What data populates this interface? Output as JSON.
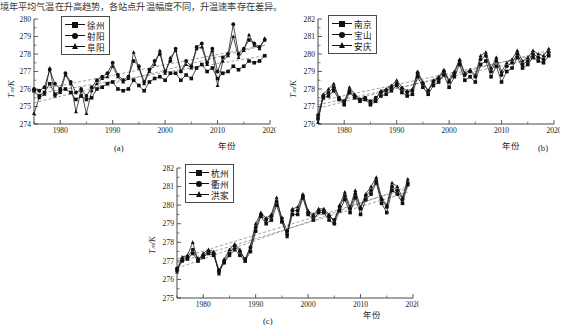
{
  "top_caption": "境年平均气温在升高趋势，各站点升温幅度不同，升温速率存在差异。",
  "axis": {
    "ylabel": "Tₘ/K",
    "xlabel": "年份",
    "xticks": [
      "1980",
      "1990",
      "2000",
      "2010",
      "2020"
    ]
  },
  "captions": {
    "a": "(a)",
    "b": "(b)",
    "c": "(c)"
  },
  "colors": {
    "line": "#111111",
    "trend": "#777777",
    "axis": "#333333",
    "frame": "#4a4a4a"
  },
  "chart_data": [
    {
      "type": "line",
      "panel": "(a)",
      "title": "",
      "xlabel": "年份",
      "ylabel": "Tₘ/K",
      "xlim": [
        1975,
        2020
      ],
      "ylim": [
        274,
        280
      ],
      "yticks": [
        274,
        275,
        276,
        277,
        278,
        279,
        280
      ],
      "xticks": [
        1980,
        1990,
        2000,
        2010,
        2020
      ],
      "grid": false,
      "legend_position": "top-left",
      "x": [
        1975,
        1976,
        1977,
        1978,
        1979,
        1980,
        1981,
        1982,
        1983,
        1984,
        1985,
        1986,
        1987,
        1988,
        1989,
        1990,
        1991,
        1992,
        1993,
        1994,
        1995,
        1996,
        1997,
        1998,
        1999,
        2000,
        2001,
        2002,
        2003,
        2004,
        2005,
        2006,
        2007,
        2008,
        2009,
        2010,
        2011,
        2012,
        2013,
        2014,
        2015,
        2016,
        2017,
        2018,
        2019
      ],
      "series": [
        {
          "name": "徐州",
          "marker": "square",
          "values": [
            275.9,
            275.6,
            275.8,
            276.3,
            275.7,
            275.9,
            276.0,
            275.8,
            275.4,
            275.6,
            275.4,
            275.5,
            276.0,
            276.1,
            276.3,
            276.4,
            276.0,
            275.9,
            276.0,
            276.5,
            276.2,
            275.9,
            276.4,
            276.6,
            276.7,
            276.5,
            276.9,
            276.9,
            276.5,
            276.8,
            276.6,
            277.2,
            277.4,
            277.0,
            277.2,
            276.6,
            276.9,
            277.0,
            277.3,
            277.1,
            277.3,
            277.6,
            277.5,
            277.6,
            277.9
          ]
        },
        {
          "name": "射阳",
          "marker": "circle",
          "values": [
            276.0,
            275.9,
            276.1,
            277.1,
            276.3,
            276.0,
            276.9,
            276.4,
            275.8,
            276.0,
            275.6,
            276.1,
            276.5,
            276.7,
            276.9,
            277.5,
            276.8,
            276.5,
            276.7,
            277.6,
            277.3,
            276.4,
            277.1,
            277.6,
            278.0,
            277.0,
            277.6,
            278.3,
            277.0,
            277.6,
            277.3,
            278.4,
            278.6,
            277.5,
            278.3,
            277.0,
            277.8,
            278.0,
            279.7,
            278.0,
            278.3,
            278.8,
            278.6,
            278.4,
            278.8
          ]
        },
        {
          "name": "阜阳",
          "marker": "triangle",
          "values": [
            274.6,
            275.5,
            275.7,
            277.2,
            275.6,
            275.8,
            276.8,
            276.3,
            274.7,
            275.9,
            274.6,
            275.9,
            276.3,
            276.6,
            276.7,
            277.3,
            276.7,
            276.4,
            276.6,
            278.1,
            277.2,
            276.3,
            277.0,
            277.4,
            278.2,
            276.9,
            277.8,
            278.2,
            277.0,
            277.4,
            277.2,
            278.3,
            278.4,
            277.4,
            278.2,
            276.2,
            277.6,
            277.9,
            279.0,
            277.8,
            278.2,
            279.1,
            278.5,
            278.3,
            278.9
          ]
        }
      ],
      "trendlines": [
        {
          "name": "徐州",
          "start": [
            1975,
            275.7
          ],
          "end": [
            2019,
            277.9
          ]
        },
        {
          "name": "射阳",
          "start": [
            1975,
            275.9
          ],
          "end": [
            2019,
            278.5
          ]
        },
        {
          "name": "阜阳",
          "start": [
            1975,
            275.2
          ],
          "end": [
            2019,
            278.5
          ]
        }
      ]
    },
    {
      "type": "line",
      "panel": "(b)",
      "title": "",
      "xlabel": "年份",
      "ylabel": "Tₘ/K",
      "xlim": [
        1975,
        2020
      ],
      "ylim": [
        276,
        282
      ],
      "yticks": [
        276,
        277,
        278,
        279,
        280,
        281,
        282
      ],
      "xticks": [
        1980,
        1990,
        2000,
        2010,
        2020
      ],
      "grid": false,
      "legend_position": "top-left",
      "x": [
        1975,
        1976,
        1977,
        1978,
        1979,
        1980,
        1981,
        1982,
        1983,
        1984,
        1985,
        1986,
        1987,
        1988,
        1989,
        1990,
        1991,
        1992,
        1993,
        1994,
        1995,
        1996,
        1997,
        1998,
        1999,
        2000,
        2001,
        2002,
        2003,
        2004,
        2005,
        2006,
        2007,
        2008,
        2009,
        2010,
        2011,
        2012,
        2013,
        2014,
        2015,
        2016,
        2017,
        2018,
        2019
      ],
      "series": [
        {
          "name": "南京",
          "marker": "square",
          "values": [
            276.3,
            277.5,
            277.6,
            277.9,
            277.4,
            277.1,
            277.8,
            277.5,
            277.3,
            277.4,
            277.1,
            277.3,
            277.6,
            277.7,
            277.9,
            278.2,
            277.8,
            277.6,
            277.7,
            278.7,
            278.1,
            277.7,
            278.2,
            278.4,
            278.8,
            278.1,
            278.7,
            279.4,
            278.5,
            278.7,
            278.4,
            279.4,
            279.6,
            278.7,
            279.3,
            278.4,
            279.0,
            279.2,
            279.8,
            279.2,
            279.4,
            279.8,
            279.6,
            279.5,
            279.9
          ]
        },
        {
          "name": "宝山",
          "marker": "circle",
          "values": [
            276.5,
            277.6,
            277.8,
            278.1,
            277.5,
            277.3,
            277.9,
            277.6,
            277.4,
            277.5,
            277.3,
            277.5,
            277.8,
            277.9,
            278.1,
            278.3,
            278.0,
            277.8,
            277.9,
            278.9,
            278.3,
            277.9,
            278.4,
            278.6,
            279.0,
            278.4,
            278.9,
            279.6,
            278.8,
            279.0,
            278.7,
            279.7,
            279.9,
            279.0,
            279.6,
            278.8,
            279.3,
            279.5,
            280.0,
            279.4,
            279.6,
            280.0,
            279.8,
            279.7,
            280.1
          ]
        },
        {
          "name": "安庆",
          "marker": "triangle",
          "values": [
            276.1,
            277.7,
            278.0,
            278.3,
            277.5,
            277.2,
            278.1,
            277.7,
            277.4,
            277.5,
            277.2,
            277.4,
            277.9,
            278.0,
            278.2,
            278.5,
            278.1,
            277.9,
            278.0,
            279.0,
            278.4,
            277.9,
            278.5,
            278.7,
            279.1,
            278.5,
            279.0,
            279.7,
            278.9,
            279.1,
            278.8,
            279.9,
            280.1,
            279.2,
            279.8,
            279.0,
            279.5,
            279.7,
            280.2,
            279.6,
            279.8,
            280.2,
            280.0,
            279.9,
            280.3
          ]
        }
      ],
      "trendlines": [
        {
          "name": "南京",
          "start": [
            1975,
            277.1
          ],
          "end": [
            2019,
            279.9
          ]
        },
        {
          "name": "宝山",
          "start": [
            1975,
            277.3
          ],
          "end": [
            2019,
            280.1
          ]
        },
        {
          "name": "安庆",
          "start": [
            1975,
            276.9
          ],
          "end": [
            2019,
            280.2
          ]
        }
      ]
    },
    {
      "type": "line",
      "panel": "(c)",
      "title": "",
      "xlabel": "年份",
      "ylabel": "Tₘ/K",
      "xlim": [
        1975,
        2020
      ],
      "ylim": [
        275,
        282
      ],
      "yticks": [
        275,
        276,
        277,
        278,
        279,
        280,
        281,
        282
      ],
      "xticks": [
        1980,
        1990,
        2000,
        2010,
        2020
      ],
      "grid": false,
      "legend_position": "top-left",
      "x": [
        1975,
        1976,
        1977,
        1978,
        1979,
        1980,
        1981,
        1982,
        1983,
        1984,
        1985,
        1986,
        1987,
        1988,
        1989,
        1990,
        1991,
        1992,
        1993,
        1994,
        1995,
        1996,
        1997,
        1998,
        1999,
        2000,
        2001,
        2002,
        2003,
        2004,
        2005,
        2006,
        2007,
        2008,
        2009,
        2010,
        2011,
        2012,
        2013,
        2014,
        2015,
        2016,
        2017,
        2018,
        2019
      ],
      "series": [
        {
          "name": "杭州",
          "marker": "square",
          "values": [
            276.5,
            277.0,
            277.1,
            277.4,
            277.0,
            277.2,
            277.4,
            277.3,
            276.4,
            276.9,
            277.3,
            277.6,
            277.3,
            277.0,
            277.5,
            278.6,
            279.4,
            279.0,
            279.2,
            280.0,
            279.1,
            278.4,
            279.5,
            279.5,
            280.4,
            279.5,
            279.2,
            279.6,
            279.6,
            279.2,
            279.0,
            279.7,
            280.3,
            279.6,
            280.4,
            279.5,
            280.3,
            280.6,
            281.2,
            280.1,
            279.6,
            280.8,
            280.6,
            280.1,
            281.1
          ]
        },
        {
          "name": "衢州",
          "marker": "circle",
          "values": [
            276.6,
            277.1,
            277.2,
            277.6,
            277.1,
            277.3,
            277.5,
            277.4,
            276.5,
            277.0,
            277.4,
            277.8,
            277.5,
            277.1,
            277.7,
            278.8,
            279.5,
            279.2,
            279.4,
            280.2,
            279.3,
            278.6,
            279.7,
            279.7,
            280.5,
            279.6,
            279.4,
            279.7,
            279.7,
            279.4,
            279.2,
            279.9,
            280.5,
            279.8,
            280.6,
            279.8,
            280.5,
            280.8,
            281.3,
            280.3,
            279.9,
            281.0,
            280.8,
            280.3,
            281.2
          ]
        },
        {
          "name": "洪家",
          "marker": "triangle",
          "values": [
            276.4,
            277.2,
            277.3,
            278.0,
            277.0,
            277.4,
            277.6,
            277.5,
            276.3,
            277.1,
            277.6,
            277.9,
            277.6,
            277.0,
            277.8,
            279.0,
            279.6,
            279.3,
            279.5,
            280.4,
            279.2,
            278.3,
            279.8,
            279.9,
            280.6,
            279.7,
            279.5,
            279.8,
            279.8,
            279.5,
            279.1,
            280.0,
            280.7,
            279.9,
            280.8,
            279.9,
            280.6,
            281.0,
            281.5,
            280.4,
            280.0,
            281.2,
            281.0,
            280.4,
            281.4
          ]
        }
      ],
      "trendlines": [
        {
          "name": "杭州",
          "start": [
            1975,
            276.9
          ],
          "end": [
            2019,
            280.7
          ]
        },
        {
          "name": "衢州",
          "start": [
            1975,
            277.1
          ],
          "end": [
            2019,
            280.9
          ]
        },
        {
          "name": "洪家",
          "start": [
            1975,
            276.6
          ],
          "end": [
            2019,
            281.0
          ]
        }
      ]
    }
  ]
}
